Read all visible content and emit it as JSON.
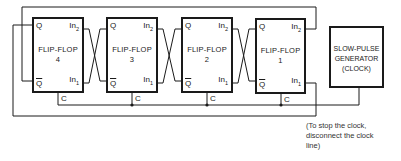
{
  "diagram": {
    "flip_flops": [
      {
        "id": "4",
        "title": "FLIP-FLOP",
        "number": "4",
        "q": "Q",
        "qbar": "Q",
        "in2": "In",
        "in2_sub": "2",
        "in1": "In",
        "in1_sub": "1",
        "clock": "C"
      },
      {
        "id": "3",
        "title": "FLIP-FLOP",
        "number": "3",
        "q": "Q",
        "qbar": "Q",
        "in2": "In",
        "in2_sub": "2",
        "in1": "In",
        "in1_sub": "1",
        "clock": "C"
      },
      {
        "id": "2",
        "title": "FLIP-FLOP",
        "number": "2",
        "q": "Q",
        "qbar": "Q",
        "in2": "In",
        "in2_sub": "2",
        "in1": "In",
        "in1_sub": "1",
        "clock": "C"
      },
      {
        "id": "1",
        "title": "FLIP-FLOP",
        "number": "1",
        "q": "Q",
        "qbar": "Q",
        "in2": "In",
        "in2_sub": "2",
        "in1": "In",
        "in1_sub": "1",
        "clock": "C"
      }
    ],
    "generator": {
      "line1": "SLOW-PULSE",
      "line2": "GENERATOR",
      "line3": "(CLOCK)"
    },
    "note": {
      "line1": "(To stop the clock,",
      "line2": "disconnect the clock",
      "line3": "line)"
    },
    "colors": {
      "line": "#1a1a1a",
      "background": "#ffffff"
    }
  }
}
